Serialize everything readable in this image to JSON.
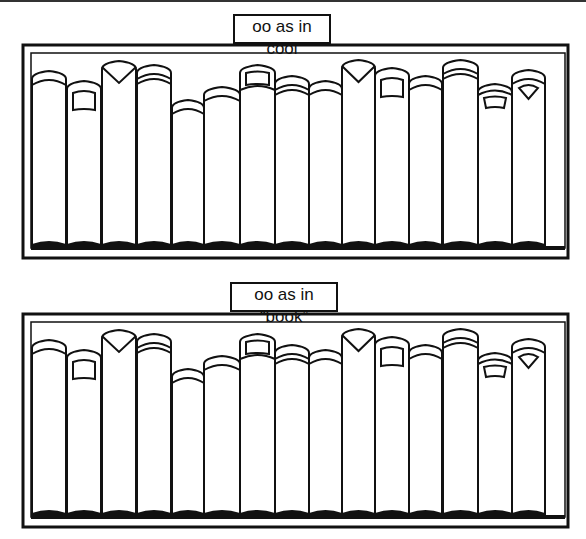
{
  "worksheet": {
    "shelves": [
      {
        "label": "oo as in “cool”",
        "book_count": 15,
        "books": [
          {
            "x": 32,
            "w": 34,
            "top": 73,
            "style": "double-band"
          },
          {
            "x": 67,
            "w": 34,
            "top": 83,
            "style": "label-patch"
          },
          {
            "x": 102,
            "w": 34,
            "top": 63,
            "style": "v-notch"
          },
          {
            "x": 137,
            "w": 34,
            "top": 67,
            "style": "triple-band"
          },
          {
            "x": 172,
            "w": 32,
            "top": 102,
            "style": "double-band"
          },
          {
            "x": 204,
            "w": 36,
            "top": 89,
            "style": "double-band"
          },
          {
            "x": 240,
            "w": 35,
            "top": 67,
            "style": "label-patch-tall"
          },
          {
            "x": 275,
            "w": 34,
            "top": 78,
            "style": "triple-band"
          },
          {
            "x": 309,
            "w": 33,
            "top": 83,
            "style": "double-band"
          },
          {
            "x": 342,
            "w": 33,
            "top": 62,
            "style": "v-notch"
          },
          {
            "x": 375,
            "w": 34,
            "top": 70,
            "style": "label-patch"
          },
          {
            "x": 409,
            "w": 33,
            "top": 78,
            "style": "double-band"
          },
          {
            "x": 443,
            "w": 35,
            "top": 62,
            "style": "triple-band"
          },
          {
            "x": 478,
            "w": 34,
            "top": 86,
            "style": "label-patch-small"
          },
          {
            "x": 512,
            "w": 33,
            "top": 72,
            "style": "fan-notch"
          }
        ]
      },
      {
        "label": "oo as in “book”",
        "book_count": 15
      }
    ]
  }
}
